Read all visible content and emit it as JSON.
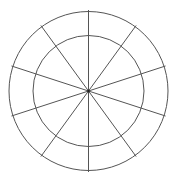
{
  "diagram": {
    "type": "polar-grid",
    "center": {
      "x": 88.5,
      "y": 91
    },
    "circles": [
      {
        "name": "inner-circle",
        "r": 55.5
      },
      {
        "name": "outer-circle",
        "r": 79.5
      }
    ],
    "spokes": {
      "count": 10,
      "start_angle_deg": 0,
      "length": 81
    },
    "colors": {
      "stroke": "#555555",
      "background": "#ffffff"
    },
    "stroke_width": 1
  }
}
